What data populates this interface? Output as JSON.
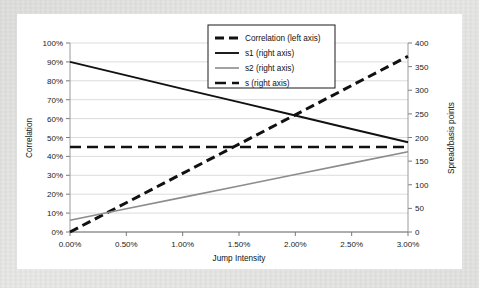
{
  "chart_data": {
    "type": "line",
    "title": "",
    "xlabel": "Jump Intensity",
    "ylabel": "Correlation",
    "y2label": "Spread/basis points",
    "xlim": [
      0,
      3
    ],
    "ylim": [
      0,
      100
    ],
    "y2lim": [
      0,
      400
    ],
    "grid": "horizontal",
    "legend_position": "top-center-right",
    "xticks": [
      "0.00%",
      "0.50%",
      "1.00%",
      "1.50%",
      "2.00%",
      "2.50%",
      "3.00%"
    ],
    "xtick_values": [
      0,
      0.5,
      1.0,
      1.5,
      2.0,
      2.5,
      3.0
    ],
    "yticks": [
      "0%",
      "10%",
      "20%",
      "30%",
      "40%",
      "50%",
      "60%",
      "70%",
      "80%",
      "90%",
      "100%"
    ],
    "ytick_values": [
      0,
      10,
      20,
      30,
      40,
      50,
      60,
      70,
      80,
      90,
      100
    ],
    "y2ticks": [
      "0",
      "50",
      "100",
      "150",
      "200",
      "250",
      "300",
      "350",
      "400"
    ],
    "y2tick_values": [
      0,
      50,
      100,
      150,
      200,
      250,
      300,
      350,
      400
    ],
    "x": [
      0,
      0.5,
      1.0,
      1.5,
      2.0,
      2.5,
      3.0
    ],
    "series": [
      {
        "name": "Correlation (left axis)",
        "axis": "left",
        "style": "dashed",
        "color": "#111111",
        "width": 3.0,
        "dash": "9,5",
        "values": [
          0,
          15.5,
          31,
          46.5,
          62,
          77.5,
          93
        ]
      },
      {
        "name": "s1 (right axis)",
        "axis": "right",
        "style": "solid",
        "color": "#111111",
        "width": 1.9,
        "dash": "",
        "values": [
          360,
          331.5,
          303,
          275,
          246.5,
          218,
          190
        ]
      },
      {
        "name": "s2 (right axis)",
        "axis": "right",
        "style": "solid",
        "color": "#8c8c8c",
        "width": 1.6,
        "dash": "",
        "values": [
          25,
          49.2,
          73.3,
          97.5,
          121.7,
          145.8,
          170
        ]
      },
      {
        "name": "s (right axis)",
        "axis": "right",
        "style": "dashed",
        "color": "#111111",
        "width": 2.6,
        "dash": "11,6",
        "values": [
          180,
          180,
          180,
          180,
          180,
          180,
          180
        ]
      }
    ]
  },
  "legend": {
    "items": [
      {
        "label": "Correlation (left axis)"
      },
      {
        "label": "s1 (right axis)"
      },
      {
        "label": "s2 (right axis)"
      },
      {
        "label": "s (right axis)"
      }
    ]
  }
}
